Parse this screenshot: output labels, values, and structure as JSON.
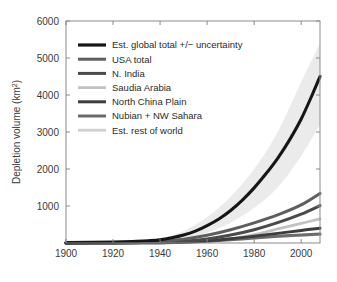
{
  "chart_data": {
    "type": "line",
    "title": "",
    "xlabel": "",
    "ylabel": "Depletion volume (km³)",
    "ylabel_text": "Depletion volume (km",
    "ylabel_sup": "2",
    "ylabel_tail": ")",
    "xlim": [
      1900,
      2008
    ],
    "ylim": [
      0,
      6000
    ],
    "grid": false,
    "xticks": [
      1900,
      1920,
      1940,
      1960,
      1980,
      2000
    ],
    "xtick_labels": [
      "1900",
      "1920",
      "1940",
      "1960",
      "1980",
      "2000"
    ],
    "yticks": [
      1000,
      2000,
      3000,
      4000,
      5000,
      6000
    ],
    "ytick_labels": [
      "1000",
      "2000",
      "3000",
      "4000",
      "5000",
      "6000"
    ],
    "legend_position": "upper-left-inside",
    "uncertainty_band": {
      "label": "Est. global total +/− uncertainty band",
      "color": "#e8e8e8",
      "x": [
        1900,
        1920,
        1930,
        1940,
        1950,
        1960,
        1970,
        1980,
        1990,
        2000,
        2008
      ],
      "upper": [
        20,
        40,
        70,
        130,
        320,
        700,
        1250,
        2000,
        3000,
        4350,
        5400
      ],
      "lower": [
        0,
        10,
        20,
        40,
        110,
        280,
        550,
        950,
        1500,
        2350,
        3200
      ]
    },
    "series": [
      {
        "name": "Est. global total +/− uncertainty",
        "color": "#161616",
        "width": 3.1,
        "x": [
          1900,
          1920,
          1930,
          1935,
          1940,
          1945,
          1950,
          1955,
          1960,
          1965,
          1970,
          1975,
          1980,
          1985,
          1990,
          1995,
          2000,
          2005,
          2008
        ],
        "y": [
          10,
          25,
          45,
          60,
          85,
          140,
          215,
          320,
          470,
          650,
          880,
          1160,
          1490,
          1870,
          2290,
          2780,
          3350,
          4050,
          4500
        ]
      },
      {
        "name": "USA total",
        "color": "#5e5e5e",
        "width": 3.0,
        "x": [
          1900,
          1920,
          1930,
          1940,
          1950,
          1960,
          1970,
          1980,
          1990,
          2000,
          2008
        ],
        "y": [
          5,
          12,
          22,
          45,
          105,
          210,
          360,
          545,
          760,
          1030,
          1340
        ]
      },
      {
        "name": "N. India",
        "color": "#4a4a4a",
        "width": 3.0,
        "x": [
          1900,
          1920,
          1930,
          1940,
          1950,
          1960,
          1970,
          1980,
          1990,
          2000,
          2008
        ],
        "y": [
          2,
          5,
          9,
          18,
          48,
          110,
          215,
          360,
          550,
          780,
          1010
        ]
      },
      {
        "name": "Saudia Arabia",
        "color": "#c2c2c2",
        "width": 2.8,
        "x": [
          1900,
          1920,
          1930,
          1940,
          1950,
          1960,
          1970,
          1980,
          1990,
          2000,
          2008
        ],
        "y": [
          1,
          2,
          3,
          6,
          16,
          45,
          110,
          225,
          380,
          530,
          650
        ]
      },
      {
        "name": "North China Plain",
        "color": "#3d3d3d",
        "width": 3.0,
        "x": [
          1900,
          1920,
          1930,
          1940,
          1950,
          1960,
          1970,
          1980,
          1990,
          2000,
          2008
        ],
        "y": [
          1,
          3,
          5,
          10,
          25,
          60,
          115,
          185,
          260,
          340,
          400
        ]
      },
      {
        "name": "Nubian + NW Sahara",
        "color": "#6b6b6b",
        "width": 3.0,
        "x": [
          1900,
          1920,
          1930,
          1940,
          1950,
          1960,
          1970,
          1980,
          1990,
          2000,
          2008
        ],
        "y": [
          1,
          2,
          4,
          8,
          20,
          48,
          88,
          135,
          180,
          215,
          240
        ]
      },
      {
        "name": "Est. rest of world",
        "color": "#cfcfcf",
        "width": 2.8,
        "x": [
          1900,
          1920,
          1930,
          1940,
          1950,
          1960,
          1970,
          1980,
          1990,
          2000,
          2008
        ],
        "y": [
          3,
          6,
          10,
          18,
          40,
          75,
          115,
          150,
          180,
          205,
          225
        ]
      }
    ]
  },
  "legend": {
    "items": [
      {
        "label": "Est. global total +/− uncertainty",
        "color": "#161616",
        "width": 3.2
      },
      {
        "label": "USA total",
        "color": "#5e5e5e",
        "width": 3.0
      },
      {
        "label": "N. India",
        "color": "#4a4a4a",
        "width": 3.0
      },
      {
        "label": "Saudia Arabia",
        "color": "#c2c2c2",
        "width": 2.8
      },
      {
        "label": "North China Plain",
        "color": "#3d3d3d",
        "width": 3.0
      },
      {
        "label": "Nubian + NW Sahara",
        "color": "#6b6b6b",
        "width": 3.0
      },
      {
        "label": "Est. rest of world",
        "color": "#cfcfcf",
        "width": 2.8
      }
    ]
  },
  "colors": {
    "axis": "#8a8a8a",
    "text": "#3a3a3a",
    "background": "#ffffff",
    "band": "#e8e8e8"
  }
}
